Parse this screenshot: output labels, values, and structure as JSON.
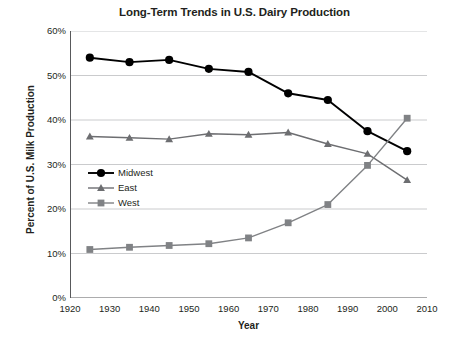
{
  "chart_data": {
    "type": "line",
    "title": "Long-Term Trends in U.S. Dairy Production",
    "xlabel": "Year",
    "ylabel": "Percent of U.S. Milk Production",
    "xlim": [
      1920,
      2010
    ],
    "ylim": [
      0,
      60
    ],
    "grid": true,
    "legend_position": "inside-left",
    "x_ticks": [
      1920,
      1930,
      1940,
      1950,
      1960,
      1970,
      1980,
      1990,
      2000,
      2010
    ],
    "x_tick_labels": [
      "1920",
      "1930",
      "1940",
      "1950",
      "1960",
      "1970",
      "1980",
      "1990",
      "2000",
      "2010"
    ],
    "y_ticks": [
      0,
      10,
      20,
      30,
      40,
      50,
      60
    ],
    "y_tick_labels": [
      "0%",
      "10%",
      "20%",
      "30%",
      "40%",
      "50%",
      "60%"
    ],
    "x": [
      1925,
      1935,
      1945,
      1955,
      1965,
      1975,
      1985,
      1995,
      2005
    ],
    "series": [
      {
        "name": "Midwest",
        "marker": "circle",
        "color": "#000000",
        "values": [
          54.0,
          53.0,
          53.5,
          51.5,
          50.8,
          46.0,
          44.5,
          37.5,
          33.0
        ]
      },
      {
        "name": "East",
        "marker": "triangle",
        "color": "#6d6e71",
        "values": [
          36.3,
          36.0,
          35.7,
          36.9,
          36.7,
          37.2,
          34.6,
          32.4,
          26.5
        ]
      },
      {
        "name": "West",
        "marker": "square",
        "color": "#808285",
        "values": [
          10.9,
          11.4,
          11.8,
          12.2,
          13.5,
          16.9,
          21.0,
          29.8,
          40.4
        ]
      }
    ]
  }
}
